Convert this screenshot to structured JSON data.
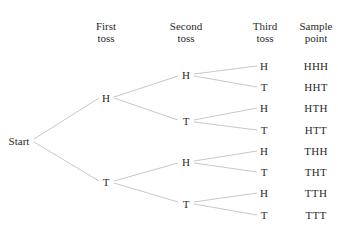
{
  "headers": {
    "first_toss": [
      "First",
      "toss"
    ],
    "second_toss": [
      "Second",
      "toss"
    ],
    "third_toss": [
      "Third",
      "toss"
    ],
    "sample_point": [
      "Sample",
      "point"
    ]
  },
  "root": "Start",
  "first": [
    "H",
    "T"
  ],
  "second": [
    "H",
    "T",
    "H",
    "T"
  ],
  "third": [
    "H",
    "T",
    "H",
    "T",
    "H",
    "T",
    "H",
    "T"
  ],
  "sample_points": [
    "HHH",
    "HHT",
    "HTH",
    "HTT",
    "THH",
    "THT",
    "TTH",
    "TTT"
  ],
  "colors": {
    "text": "#2a2a2a",
    "line": "#c8c8c8",
    "background": "#ffffff"
  }
}
